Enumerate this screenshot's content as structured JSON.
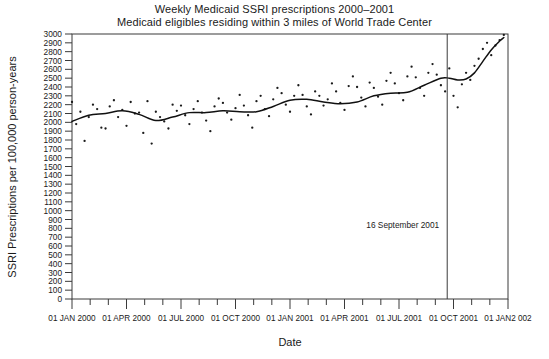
{
  "chart_data": {
    "type": "scatter",
    "title": "Weekly Medicaid SSRI prescriptions 2000–2001",
    "subtitle": "Medicaid eligibles residing within 3 miles of World Trade Center",
    "xlabel": "Date",
    "ylabel": "SSRI Prescriptions per 100,000 person-years",
    "ylim": [
      0,
      3000
    ],
    "ytick_step": 100,
    "ytick_labels": [
      "3000",
      "2900",
      "2800",
      "2700",
      "2600",
      "2500",
      "2400",
      "2300",
      "2200",
      "2100",
      "2000",
      "1900",
      "1800",
      "1700",
      "1600",
      "1500",
      "1400",
      "1300",
      "1200",
      "1100",
      "1000",
      "900",
      "800",
      "700",
      "600",
      "500",
      "400",
      "300",
      "200",
      "100",
      "0"
    ],
    "xlim": [
      "01 JAN 2000",
      "01 JAN 2002"
    ],
    "xtick_labels": [
      "01 JAN 2000",
      "01 APR 2000",
      "01 JUL 2000",
      "01 OCT 2000",
      "01 JAN 2001",
      "01 APR 2001",
      "01 JUL 2001",
      "01 OCT 2001",
      "01 JAN2 002"
    ],
    "xtick_weeks": [
      0,
      13,
      26,
      39,
      52,
      65,
      78,
      91,
      104
    ],
    "minor_tick_interval_weeks": 4.333,
    "grid": false,
    "legend": null,
    "annotations": [
      {
        "label": "16 September 2001",
        "x_week": 89,
        "y": 800,
        "type": "event-line-label"
      }
    ],
    "event_line": {
      "label": "16 September 2001",
      "x_week": 89.5
    },
    "series": [
      {
        "name": "Weekly observed rate",
        "type": "scatter",
        "marker": "dot",
        "x": [
          0,
          1,
          2,
          3,
          4,
          5,
          6,
          7,
          8,
          9,
          10,
          11,
          12,
          13,
          14,
          15,
          16,
          17,
          18,
          19,
          20,
          21,
          22,
          23,
          24,
          25,
          26,
          27,
          28,
          29,
          30,
          31,
          32,
          33,
          34,
          35,
          36,
          37,
          38,
          39,
          40,
          41,
          42,
          43,
          44,
          45,
          46,
          47,
          48,
          49,
          50,
          51,
          52,
          53,
          54,
          55,
          56,
          57,
          58,
          59,
          60,
          61,
          62,
          63,
          64,
          65,
          66,
          67,
          68,
          69,
          70,
          71,
          72,
          73,
          74,
          75,
          76,
          77,
          78,
          79,
          80,
          81,
          82,
          83,
          84,
          85,
          86,
          87,
          88,
          89,
          90,
          91,
          92,
          93,
          94,
          95,
          96,
          97,
          98,
          99,
          100,
          101,
          102,
          103
        ],
        "values": [
          2230,
          1980,
          2120,
          1790,
          2060,
          2200,
          2150,
          1940,
          1930,
          2180,
          2250,
          2060,
          2140,
          1960,
          2230,
          2100,
          2110,
          1880,
          2240,
          1760,
          2120,
          2060,
          2010,
          1930,
          2200,
          2130,
          2190,
          2080,
          1980,
          2150,
          2240,
          2110,
          2020,
          1900,
          2180,
          2270,
          2220,
          2110,
          2030,
          2160,
          2310,
          2190,
          2080,
          1940,
          2240,
          2300,
          2150,
          2070,
          2260,
          2390,
          2330,
          2200,
          2120,
          2300,
          2420,
          2310,
          2180,
          2090,
          2350,
          2300,
          2190,
          2260,
          2440,
          2350,
          2220,
          2140,
          2410,
          2520,
          2400,
          2280,
          2180,
          2450,
          2390,
          2290,
          2200,
          2470,
          2560,
          2440,
          2330,
          2250,
          2520,
          2630,
          2510,
          2390,
          2300,
          2560,
          2660,
          2540,
          2420,
          2350,
          2610,
          2300,
          2170,
          2430,
          2560,
          2480,
          2640,
          2720,
          2830,
          2900,
          2760,
          2870,
          2930,
          2990
        ]
      },
      {
        "name": "Smoothed trend",
        "type": "line",
        "x": [
          0,
          4,
          8,
          12,
          16,
          20,
          24,
          28,
          32,
          36,
          40,
          44,
          48,
          52,
          56,
          60,
          64,
          68,
          72,
          76,
          80,
          84,
          88,
          90,
          92,
          94,
          96,
          98,
          100,
          102,
          103
        ],
        "values": [
          2010,
          2080,
          2100,
          2130,
          2090,
          2020,
          2060,
          2110,
          2110,
          2130,
          2120,
          2120,
          2180,
          2250,
          2260,
          2230,
          2210,
          2230,
          2300,
          2330,
          2340,
          2420,
          2500,
          2500,
          2480,
          2490,
          2560,
          2690,
          2820,
          2920,
          2960
        ]
      }
    ]
  }
}
